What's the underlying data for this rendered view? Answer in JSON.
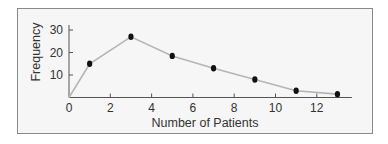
{
  "chart_data": {
    "type": "line",
    "title": "",
    "xlabel": "Number of Patients",
    "ylabel": "Frequency",
    "x": [
      0,
      1,
      3,
      5,
      7,
      9,
      11,
      13
    ],
    "series": [
      {
        "name": "Frequency",
        "values": [
          0,
          15,
          27,
          18.5,
          13,
          8,
          3,
          1.5
        ],
        "markers": [
          false,
          true,
          true,
          true,
          true,
          true,
          true,
          true
        ]
      }
    ],
    "xticks": [
      0,
      2,
      4,
      6,
      8,
      10,
      12
    ],
    "yticks": [
      10,
      20,
      30
    ],
    "xlim": [
      0,
      13.7
    ],
    "ylim": [
      0,
      32
    ],
    "grid": false,
    "legend": null,
    "colors": {
      "line": "#b5b5b5",
      "marker": "#111111",
      "axis": "#555555",
      "frame_border": "#8a8a8a",
      "frame_background": "#f6f6f6"
    }
  }
}
